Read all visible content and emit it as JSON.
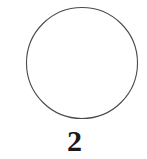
{
  "figure": {
    "caption": "2",
    "background_color": "#ffffff",
    "shapes": [
      {
        "name": "circle",
        "kind": "circle-outline",
        "center_x": 82,
        "center_y": 63,
        "radius": 55.5,
        "stroke_color": "#4a4a4a",
        "stroke_width": 1.1,
        "fill": "none"
      }
    ],
    "caption_color": "#1a1a1a"
  }
}
